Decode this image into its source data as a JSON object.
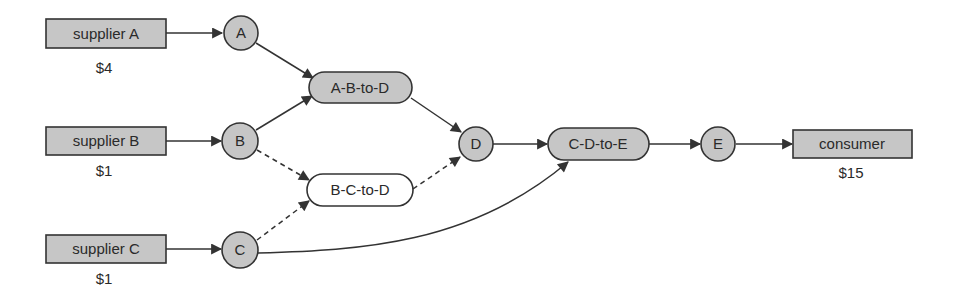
{
  "diagram": {
    "type": "supply-chain-network",
    "suppliers": [
      {
        "id": "supplier-a",
        "label": "supplier A",
        "price": "$4"
      },
      {
        "id": "supplier-b",
        "label": "supplier B",
        "price": "$1"
      },
      {
        "id": "supplier-c",
        "label": "supplier C",
        "price": "$1"
      }
    ],
    "goods": [
      {
        "id": "good-a",
        "label": "A"
      },
      {
        "id": "good-b",
        "label": "B"
      },
      {
        "id": "good-c",
        "label": "C"
      },
      {
        "id": "good-d",
        "label": "D"
      },
      {
        "id": "good-e",
        "label": "E"
      }
    ],
    "producers": [
      {
        "id": "a-b-to-d",
        "label": "A-B-to-D",
        "style": "filled"
      },
      {
        "id": "b-c-to-d",
        "label": "B-C-to-D",
        "style": "open"
      },
      {
        "id": "c-d-to-e",
        "label": "C-D-to-E",
        "style": "filled"
      }
    ],
    "consumer": {
      "id": "consumer",
      "label": "consumer",
      "price": "$15"
    },
    "edges": [
      {
        "from": "supplier A",
        "to": "A",
        "style": "solid"
      },
      {
        "from": "supplier B",
        "to": "B",
        "style": "solid"
      },
      {
        "from": "supplier C",
        "to": "C",
        "style": "solid"
      },
      {
        "from": "A",
        "to": "A-B-to-D",
        "style": "solid"
      },
      {
        "from": "B",
        "to": "A-B-to-D",
        "style": "solid"
      },
      {
        "from": "B",
        "to": "B-C-to-D",
        "style": "dashed"
      },
      {
        "from": "C",
        "to": "B-C-to-D",
        "style": "dashed"
      },
      {
        "from": "A-B-to-D",
        "to": "D",
        "style": "solid"
      },
      {
        "from": "B-C-to-D",
        "to": "D",
        "style": "dashed"
      },
      {
        "from": "D",
        "to": "C-D-to-E",
        "style": "solid"
      },
      {
        "from": "C",
        "to": "C-D-to-E",
        "style": "solid-curved"
      },
      {
        "from": "C-D-to-E",
        "to": "E",
        "style": "solid"
      },
      {
        "from": "E",
        "to": "consumer",
        "style": "solid"
      }
    ],
    "colors": {
      "fill": "#c6c6c6",
      "stroke": "#333333",
      "text": "#2a2a2a",
      "background": "#ffffff"
    }
  }
}
